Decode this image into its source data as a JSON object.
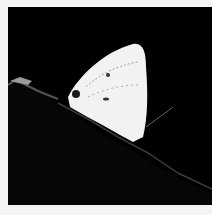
{
  "image": {
    "subject": "white butterfly resting on a dark leaf",
    "background_color": "#000000",
    "frame_color": "#f4f4f4",
    "wing_color": "#f2f2f0"
  }
}
